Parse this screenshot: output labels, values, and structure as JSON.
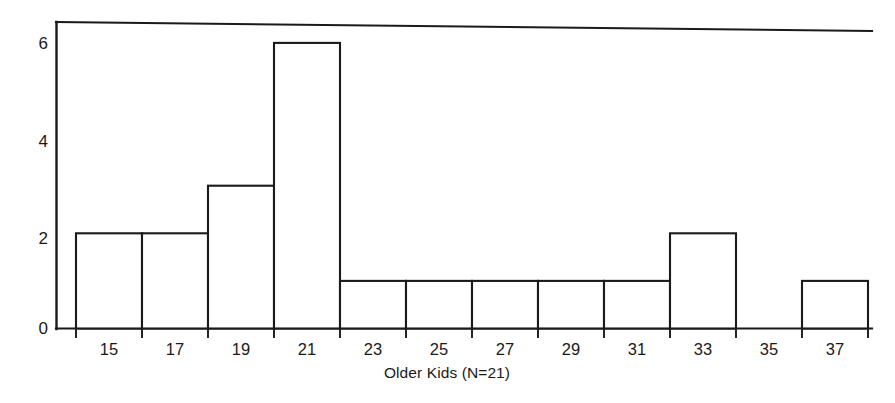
{
  "chart_data": {
    "type": "bar",
    "title": "",
    "subtitle": "",
    "xlabel": "Older Kids (N=21)",
    "ylabel": "",
    "categories": [
      "15",
      "17",
      "19",
      "21",
      "23",
      "25",
      "27",
      "29",
      "31",
      "33",
      "35",
      "37"
    ],
    "values": [
      2,
      2,
      3,
      6,
      1,
      1,
      1,
      1,
      1,
      2,
      0,
      1
    ],
    "bin_width": 2,
    "total_count": 21,
    "ylim": [
      0,
      6.3
    ],
    "xlim": [
      14,
      38
    ],
    "yticks": [
      0,
      2,
      4,
      6
    ],
    "ytick_labels": [
      "0",
      "2",
      "4",
      "6"
    ],
    "xtick_labels": [
      "15",
      "17",
      "19",
      "21",
      "23",
      "25",
      "27",
      "29",
      "31",
      "33",
      "35",
      "37"
    ],
    "grid": false,
    "legend": null,
    "legend_position": "none",
    "bar_fill": "#ffffff",
    "bar_stroke": "#1a1a1a",
    "axis_color": "#1a1a1a",
    "background": "#ffffff",
    "annotations": []
  },
  "figure": {
    "caption": "",
    "xaxis_label": "Older Kids (N=21)"
  }
}
